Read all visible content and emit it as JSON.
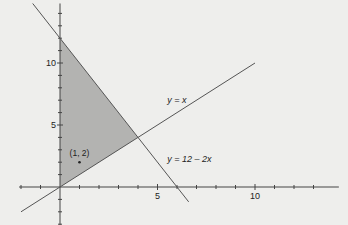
{
  "chart_data": {
    "type": "line",
    "title": "",
    "xlabel": "",
    "ylabel": "",
    "xlim": [
      -2.1,
      14.3
    ],
    "ylim": [
      -3.4,
      14.8
    ],
    "grid": false,
    "x_ticks": [
      -2,
      -1,
      1,
      2,
      3,
      4,
      5,
      6,
      7,
      8,
      9,
      10,
      11,
      12,
      13
    ],
    "x_tick_labels": [
      {
        "value": 5,
        "text": "5"
      },
      {
        "value": 10,
        "text": "10"
      }
    ],
    "y_ticks": [
      -3,
      -2,
      -1,
      1,
      2,
      3,
      4,
      5,
      6,
      7,
      8,
      9,
      10,
      11,
      12,
      13,
      14
    ],
    "y_tick_labels": [
      {
        "value": 5,
        "text": "5"
      },
      {
        "value": 10,
        "text": "10"
      }
    ],
    "series": [
      {
        "name": "y = x",
        "label": "y = x",
        "x": [
          -2,
          10
        ],
        "y": [
          -2,
          10
        ]
      },
      {
        "name": "y = 12 - 2x",
        "label": "y = 12 – 2x",
        "x": [
          -1.4,
          6.6
        ],
        "y": [
          14.8,
          -1.2
        ]
      }
    ],
    "shaded_region": {
      "vertices": [
        [
          0,
          0
        ],
        [
          0,
          12
        ],
        [
          4,
          4
        ]
      ],
      "color": "#b3b3b1"
    },
    "points": [
      {
        "x": 1,
        "y": 2,
        "label": "(1, 2)"
      }
    ],
    "annotations": [
      {
        "text": "y = x",
        "x": 5.5,
        "y": 6.8
      },
      {
        "text": "y = 12 – 2x",
        "x": 5.5,
        "y": 2.0
      }
    ]
  }
}
